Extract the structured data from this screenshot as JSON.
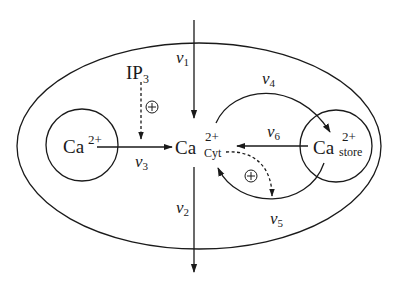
{
  "diagram": {
    "type": "calcium-signaling-compartment-model",
    "compartments": {
      "cell": {
        "label": ""
      },
      "extracellular_pool": {
        "ion": "Ca",
        "charge": "2+"
      },
      "cytosol": {
        "ion": "Ca",
        "charge": "2+",
        "subscript": "Cyt"
      },
      "store": {
        "ion": "Ca",
        "charge": "2+",
        "subscript": "store"
      }
    },
    "messenger": {
      "name": "IP",
      "subscript": "3"
    },
    "activation_symbol": "⊕",
    "fluxes": [
      {
        "id": "v1",
        "symbol": "v",
        "index": "1",
        "from": "outside",
        "to": "cytosol"
      },
      {
        "id": "v2",
        "symbol": "v",
        "index": "2",
        "from": "cytosol",
        "to": "outside"
      },
      {
        "id": "v3",
        "symbol": "v",
        "index": "3",
        "from": "extracellular_pool",
        "to": "cytosol"
      },
      {
        "id": "v4",
        "symbol": "v",
        "index": "4",
        "from": "cytosol",
        "to": "store"
      },
      {
        "id": "v5",
        "symbol": "v",
        "index": "5",
        "from": "store",
        "to": "cytosol"
      },
      {
        "id": "v6",
        "symbol": "v",
        "index": "6",
        "from": "store",
        "to": "cytosol"
      }
    ],
    "regulations": [
      {
        "from": "IP3",
        "to": "v3",
        "sign": "+"
      },
      {
        "from": "cytosol",
        "to": "v5",
        "sign": "+"
      }
    ]
  },
  "caption": {
    "text": ""
  }
}
